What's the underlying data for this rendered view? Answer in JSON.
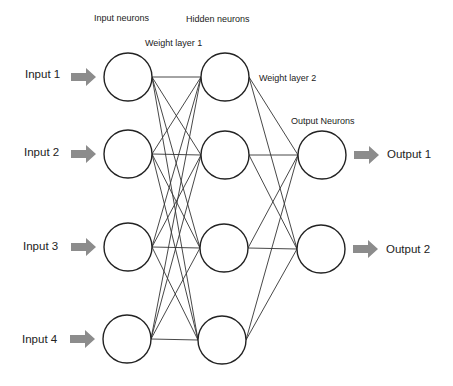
{
  "headers": {
    "input_neurons": "Input neurons",
    "hidden_neurons": "Hidden neurons",
    "weight_layer_1": "Weight layer 1",
    "weight_layer_2": "Weight layer 2",
    "output_neurons": "Output Neurons"
  },
  "inputs": [
    {
      "label": "Input 1"
    },
    {
      "label": "Input 2"
    },
    {
      "label": "Input 3"
    },
    {
      "label": "Input 4"
    }
  ],
  "outputs": [
    {
      "label": "Output 1"
    },
    {
      "label": "Output 2"
    }
  ],
  "layers": {
    "input": [
      [
        128,
        77
      ],
      [
        128,
        154
      ],
      [
        128,
        247
      ],
      [
        127,
        339
      ]
    ],
    "hidden": [
      [
        225,
        77
      ],
      [
        225,
        155
      ],
      [
        224,
        248
      ],
      [
        222,
        340
      ]
    ],
    "output": [
      [
        322,
        155
      ],
      [
        321,
        249
      ]
    ]
  },
  "style": {
    "node_radius": 24,
    "node_stroke": "#222222",
    "edge_stroke": "#333333",
    "arrow_fill": "#8c8c8c"
  }
}
